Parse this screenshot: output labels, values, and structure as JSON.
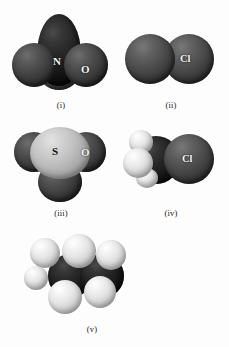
{
  "figure": {
    "background_color": "#fdfdfd",
    "layout": "2-column grid of five space-filling molecular models"
  },
  "palette": {
    "oxygen": "#3b3b3b",
    "nitrogen": "#1a1a1a",
    "chlorine": "#4a4a4a",
    "sulfur": "#c0c0c0",
    "carbon": "#101010",
    "hydrogen": "#f2f2f2",
    "label_light": "#f2f2f2",
    "label_dark": "#111111"
  },
  "models": [
    {
      "caption": "(i)",
      "name": "nitrogen-oxide-model",
      "atom_labels": {
        "center": "N",
        "outer": "O"
      },
      "atoms": [
        "N",
        "O",
        "O",
        "O"
      ]
    },
    {
      "caption": "(ii)",
      "name": "chlorine-molecule-model",
      "atom_labels": {
        "right": "Cl"
      },
      "atoms": [
        "Cl",
        "Cl"
      ]
    },
    {
      "caption": "(iii)",
      "name": "sulfur-oxide-model",
      "atom_labels": {
        "center": "S",
        "outer": "O"
      },
      "atoms": [
        "S",
        "O",
        "O",
        "O"
      ]
    },
    {
      "caption": "(iv)",
      "name": "chloromethane-model",
      "atom_labels": {
        "right": "Cl"
      },
      "atoms": [
        "C",
        "H",
        "H",
        "H",
        "Cl"
      ]
    },
    {
      "caption": "(v)",
      "name": "ethane-model",
      "atom_labels": {},
      "atoms": [
        "C",
        "C",
        "H",
        "H",
        "H",
        "H",
        "H",
        "H"
      ]
    }
  ]
}
